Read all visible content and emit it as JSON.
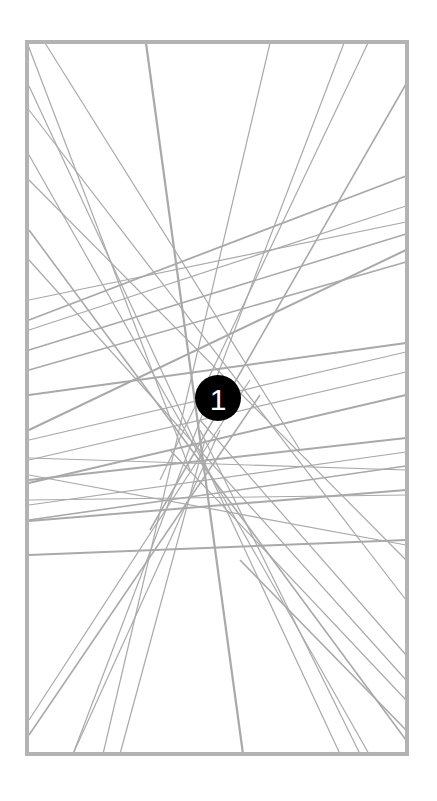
{
  "figure": {
    "width": 437,
    "height": 801,
    "background": "#ffffff",
    "frame": {
      "x": 27,
      "y": 42,
      "width": 380,
      "height": 712,
      "stroke": "#b3b3b3",
      "stroke_width": 4
    },
    "line_color": "#a9a9a9",
    "lines": [
      {
        "x1": 28,
        "y1": 45,
        "x2": 190,
        "y2": 470,
        "w": 1.2
      },
      {
        "x1": 45,
        "y1": 43,
        "x2": 300,
        "y2": 450,
        "w": 1.2
      },
      {
        "x1": 146,
        "y1": 43,
        "x2": 243,
        "y2": 754,
        "w": 2.2
      },
      {
        "x1": 270,
        "y1": 43,
        "x2": 103,
        "y2": 754,
        "w": 1.2
      },
      {
        "x1": 344,
        "y1": 43,
        "x2": 73,
        "y2": 754,
        "w": 1.2
      },
      {
        "x1": 368,
        "y1": 43,
        "x2": 160,
        "y2": 480,
        "w": 1.2
      },
      {
        "x1": 406,
        "y1": 84,
        "x2": 150,
        "y2": 530,
        "w": 1.6
      },
      {
        "x1": 29,
        "y1": 86,
        "x2": 340,
        "y2": 754,
        "w": 1.2
      },
      {
        "x1": 29,
        "y1": 110,
        "x2": 406,
        "y2": 600,
        "w": 1.2
      },
      {
        "x1": 29,
        "y1": 155,
        "x2": 369,
        "y2": 754,
        "w": 1.2
      },
      {
        "x1": 29,
        "y1": 180,
        "x2": 406,
        "y2": 560,
        "w": 1.2
      },
      {
        "x1": 29,
        "y1": 230,
        "x2": 406,
        "y2": 740,
        "w": 1.6
      },
      {
        "x1": 29,
        "y1": 260,
        "x2": 406,
        "y2": 680,
        "w": 1.2
      },
      {
        "x1": 406,
        "y1": 176,
        "x2": 29,
        "y2": 320,
        "w": 1.8
      },
      {
        "x1": 406,
        "y1": 206,
        "x2": 29,
        "y2": 330,
        "w": 1.2
      },
      {
        "x1": 406,
        "y1": 222,
        "x2": 29,
        "y2": 300,
        "w": 1.2
      },
      {
        "x1": 406,
        "y1": 234,
        "x2": 29,
        "y2": 350,
        "w": 1.6
      },
      {
        "x1": 406,
        "y1": 250,
        "x2": 29,
        "y2": 430,
        "w": 2.0
      },
      {
        "x1": 406,
        "y1": 262,
        "x2": 29,
        "y2": 370,
        "w": 1.6
      },
      {
        "x1": 406,
        "y1": 343,
        "x2": 29,
        "y2": 395,
        "w": 2.0
      },
      {
        "x1": 406,
        "y1": 352,
        "x2": 29,
        "y2": 440,
        "w": 1.2
      },
      {
        "x1": 406,
        "y1": 372,
        "x2": 29,
        "y2": 460,
        "w": 1.2
      },
      {
        "x1": 406,
        "y1": 395,
        "x2": 29,
        "y2": 483,
        "w": 2.0
      },
      {
        "x1": 406,
        "y1": 438,
        "x2": 29,
        "y2": 480,
        "w": 2.0
      },
      {
        "x1": 406,
        "y1": 452,
        "x2": 29,
        "y2": 505,
        "w": 1.2
      },
      {
        "x1": 406,
        "y1": 466,
        "x2": 29,
        "y2": 520,
        "w": 1.6
      },
      {
        "x1": 406,
        "y1": 490,
        "x2": 29,
        "y2": 521,
        "w": 2.0
      },
      {
        "x1": 406,
        "y1": 540,
        "x2": 29,
        "y2": 555,
        "w": 2.0
      },
      {
        "x1": 29,
        "y1": 458,
        "x2": 406,
        "y2": 470,
        "w": 1.2
      },
      {
        "x1": 29,
        "y1": 475,
        "x2": 406,
        "y2": 545,
        "w": 1.2
      },
      {
        "x1": 29,
        "y1": 500,
        "x2": 406,
        "y2": 495,
        "w": 1.2
      },
      {
        "x1": 29,
        "y1": 720,
        "x2": 250,
        "y2": 380,
        "w": 1.2
      },
      {
        "x1": 29,
        "y1": 735,
        "x2": 260,
        "y2": 395,
        "w": 1.6
      },
      {
        "x1": 73,
        "y1": 754,
        "x2": 220,
        "y2": 430,
        "w": 1.2
      },
      {
        "x1": 120,
        "y1": 754,
        "x2": 205,
        "y2": 440,
        "w": 1.2
      },
      {
        "x1": 406,
        "y1": 730,
        "x2": 240,
        "y2": 560,
        "w": 1.6
      },
      {
        "x1": 406,
        "y1": 700,
        "x2": 170,
        "y2": 450,
        "w": 1.2
      },
      {
        "x1": 406,
        "y1": 655,
        "x2": 200,
        "y2": 420,
        "w": 1.2
      },
      {
        "x1": 360,
        "y1": 754,
        "x2": 200,
        "y2": 430,
        "w": 1.2
      }
    ]
  },
  "badge": {
    "label": "1",
    "cx": 218,
    "cy": 398,
    "r": 23,
    "fill": "#000000",
    "text_color": "#ffffff"
  }
}
